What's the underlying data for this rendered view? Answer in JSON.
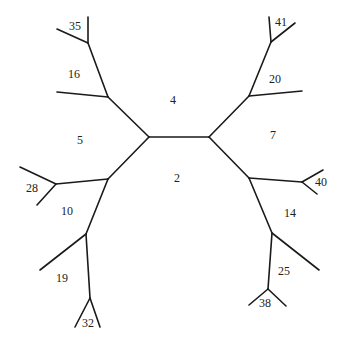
{
  "diagram": {
    "type": "unrooted-tree",
    "stroke_color": "#1a1a1a",
    "nodes": {
      "cL": [
        149,
        137
      ],
      "cR": [
        209,
        137
      ],
      "uL": [
        108,
        97
      ],
      "n35": [
        88,
        43
      ],
      "l35a": [
        57,
        29
      ],
      "l35b": [
        88,
        17
      ],
      "l16": [
        57,
        92
      ],
      "dL": [
        108,
        179
      ],
      "n28": [
        56,
        184
      ],
      "l28a": [
        20,
        167
      ],
      "l28b": [
        37,
        205
      ],
      "n19": [
        86,
        234
      ],
      "l19": [
        40,
        270
      ],
      "n32": [
        90,
        298
      ],
      "l32a": [
        75,
        327
      ],
      "l32b": [
        100,
        327
      ],
      "uR": [
        249,
        96
      ],
      "n41": [
        271,
        42
      ],
      "l41a": [
        269,
        17
      ],
      "l41b": [
        295,
        23
      ],
      "l20": [
        302,
        91
      ],
      "dR": [
        249,
        178
      ],
      "n40": [
        302,
        182
      ],
      "l40a": [
        323,
        170
      ],
      "l40b": [
        317,
        194
      ],
      "n14": [
        272,
        233
      ],
      "l14": [
        319,
        270
      ],
      "n38": [
        268,
        289
      ],
      "l38a": [
        249,
        305
      ],
      "l38b": [
        286,
        306
      ]
    },
    "edges": [
      [
        "cL",
        "cR"
      ],
      [
        "cL",
        "uL"
      ],
      [
        "uL",
        "n35"
      ],
      [
        "n35",
        "l35a"
      ],
      [
        "n35",
        "l35b"
      ],
      [
        "uL",
        "l16"
      ],
      [
        "cL",
        "dL"
      ],
      [
        "dL",
        "n28"
      ],
      [
        "n28",
        "l28a"
      ],
      [
        "n28",
        "l28b"
      ],
      [
        "dL",
        "n19"
      ],
      [
        "n19",
        "l19"
      ],
      [
        "n19",
        "n32"
      ],
      [
        "n32",
        "l32a"
      ],
      [
        "n32",
        "l32b"
      ],
      [
        "cR",
        "uR"
      ],
      [
        "uR",
        "n41"
      ],
      [
        "n41",
        "l41a"
      ],
      [
        "n41",
        "l41b"
      ],
      [
        "uR",
        "l20"
      ],
      [
        "cR",
        "dR"
      ],
      [
        "dR",
        "n40"
      ],
      [
        "n40",
        "l40a"
      ],
      [
        "n40",
        "l40b"
      ],
      [
        "dR",
        "n14"
      ],
      [
        "n14",
        "l14"
      ],
      [
        "n14",
        "n38"
      ],
      [
        "n38",
        "l38a"
      ],
      [
        "n38",
        "l38b"
      ]
    ],
    "labels": [
      {
        "text": "35",
        "x": 69,
        "y": 30
      },
      {
        "text": "16",
        "x": 68,
        "y": 78
      },
      {
        "text": "4",
        "x": 170,
        "y": 104
      },
      {
        "text": "5",
        "x": 77,
        "y": 144
      },
      {
        "text": "28",
        "x": 26,
        "y": 192
      },
      {
        "text": "10",
        "x": 61,
        "y": 215
      },
      {
        "text": "19",
        "x": 56,
        "y": 282
      },
      {
        "text": "32",
        "x": 82,
        "y": 327
      },
      {
        "text": "2",
        "x": 174,
        "y": 182
      },
      {
        "text": "41",
        "x": 275,
        "y": 26
      },
      {
        "text": "20",
        "x": 269,
        "y": 83
      },
      {
        "text": "7",
        "x": 270,
        "y": 139
      },
      {
        "text": "40",
        "x": 315,
        "y": 186
      },
      {
        "text": "14",
        "x": 284,
        "y": 217
      },
      {
        "text": "25",
        "x": 278,
        "y": 275
      },
      {
        "text": "38",
        "x": 259,
        "y": 307
      }
    ]
  }
}
